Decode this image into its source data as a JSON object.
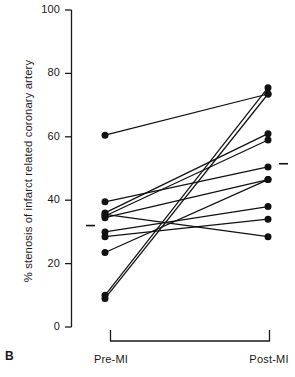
{
  "panel": {
    "label": "B"
  },
  "chart_data": {
    "type": "line",
    "title": "",
    "subtitle": "",
    "xlabel": "",
    "ylabel": "% stenosis of infarct related coronary artery",
    "categories": [
      "Pre-MI",
      "Post-MI"
    ],
    "ylim": [
      0,
      100
    ],
    "yticks": [
      0,
      20,
      40,
      60,
      80,
      100
    ],
    "ytick_labels": [
      "0",
      "20",
      "40",
      "60",
      "80",
      "100"
    ],
    "grid": false,
    "legend": null,
    "legend_position": "none",
    "marker": "filled-circle",
    "annotations": [
      {
        "name": "mean-marker-pre",
        "category": "Pre-MI",
        "value": 32
      },
      {
        "name": "mean-marker-post",
        "category": "Post-MI",
        "value": 51.5
      }
    ],
    "series": [
      {
        "name": "subject-1",
        "values": [
          60.5,
          73.5
        ]
      },
      {
        "name": "subject-2",
        "values": [
          39.5,
          50.5
        ]
      },
      {
        "name": "subject-3",
        "values": [
          36.0,
          61.0
        ]
      },
      {
        "name": "subject-4",
        "values": [
          35.5,
          28.5
        ]
      },
      {
        "name": "subject-5",
        "values": [
          35.0,
          59.0
        ]
      },
      {
        "name": "subject-6",
        "values": [
          34.5,
          46.5
        ]
      },
      {
        "name": "subject-7",
        "values": [
          30.0,
          38.0
        ]
      },
      {
        "name": "subject-8",
        "values": [
          28.5,
          34.0
        ]
      },
      {
        "name": "subject-9",
        "values": [
          23.5,
          46.5
        ]
      },
      {
        "name": "subject-10",
        "values": [
          10.0,
          75.5
        ]
      },
      {
        "name": "subject-11",
        "values": [
          9.0,
          73.5
        ]
      }
    ]
  }
}
